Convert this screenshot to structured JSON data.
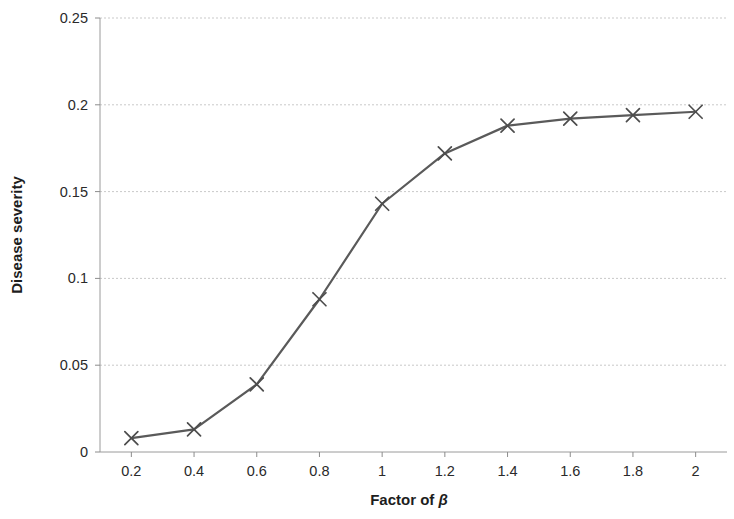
{
  "chart_data": {
    "type": "line",
    "title": "",
    "subtitle": "",
    "xlabel": "Factor of β",
    "xlabel_prefix": "Factor of ",
    "xlabel_symbol": "β",
    "ylabel": "Disease severity",
    "x": [
      0.2,
      0.4,
      0.6,
      0.8,
      1.0,
      1.2,
      1.4,
      1.6,
      1.8,
      2.0
    ],
    "values": [
      0.008,
      0.013,
      0.039,
      0.088,
      0.143,
      0.172,
      0.188,
      0.192,
      0.194,
      0.196
    ],
    "series": [
      {
        "name": "Disease severity",
        "values": [
          0.008,
          0.013,
          0.039,
          0.088,
          0.143,
          0.172,
          0.188,
          0.192,
          0.194,
          0.196
        ]
      }
    ],
    "xlim": [
      0.1,
      2.1
    ],
    "ylim": [
      0,
      0.25
    ],
    "xticks": [
      0.2,
      0.4,
      0.6,
      0.8,
      1.0,
      1.2,
      1.4,
      1.6,
      1.8,
      2.0
    ],
    "xtick_labels": [
      "0.2",
      "0.4",
      "0.6",
      "0.8",
      "1",
      "1.2",
      "1.4",
      "1.6",
      "1.8",
      "2"
    ],
    "yticks": [
      0,
      0.05,
      0.1,
      0.15,
      0.2,
      0.25
    ],
    "ytick_labels": [
      "0",
      "0.05",
      "0.1",
      "0.15",
      "0.2",
      "0.25"
    ],
    "grid": "horizontal",
    "legend": "none",
    "marker": "x-cross",
    "line_color": "#5a5a5a",
    "marker_color": "#4d4d4d",
    "grid_color": "#c9c9c9",
    "axis_color": "#9a9a9a",
    "background_color": "#ffffff",
    "text_color": "#231f20"
  }
}
